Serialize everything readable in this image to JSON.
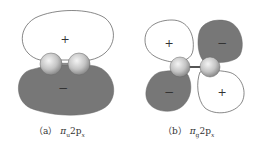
{
  "figure": {
    "panels": [
      {
        "id": "a",
        "label_prefix": "（a）",
        "symbol": "π",
        "symbol_sub": "u",
        "orbital": "2p",
        "orbital_sub": "x",
        "lobes": [
          {
            "position": "top",
            "sign": "+",
            "fill": "#ffffff"
          },
          {
            "position": "bottom",
            "sign": "−",
            "fill": "#777777"
          }
        ]
      },
      {
        "id": "b",
        "label_prefix": "（b）",
        "symbol": "π",
        "symbol_sub": "g",
        "orbital": "2p",
        "orbital_sub": "x",
        "lobes": [
          {
            "position": "top-left",
            "sign": "+",
            "fill": "#ffffff"
          },
          {
            "position": "top-right",
            "sign": "−",
            "fill": "#777777"
          },
          {
            "position": "bottom-left",
            "sign": "−",
            "fill": "#777777"
          },
          {
            "position": "bottom-right",
            "sign": "+",
            "fill": "#ffffff"
          }
        ]
      }
    ],
    "colors": {
      "shaded": "#777777",
      "outline": "#555555",
      "atom": "#c8c8c8"
    }
  }
}
